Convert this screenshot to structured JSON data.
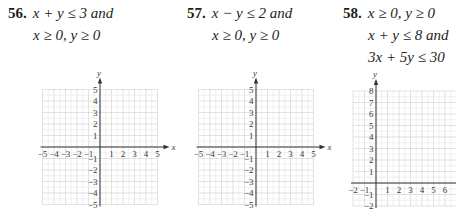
{
  "problems": [
    {
      "number": "56.",
      "lines": [
        "x + y ≤ 3 and",
        "x ≥ 0, y ≥ 0"
      ],
      "graph": {
        "xmin": -5,
        "xmax": 5,
        "ymin": -5,
        "ymax": 5,
        "x_axis_label": "x",
        "y_axis_label": "y"
      }
    },
    {
      "number": "57.",
      "lines": [
        "x − y ≤ 2 and",
        "x ≥ 0, y ≥ 0"
      ],
      "graph": {
        "xmin": -5,
        "xmax": 5,
        "ymin": -5,
        "ymax": 5,
        "x_axis_label": "x",
        "y_axis_label": "y"
      }
    },
    {
      "number": "58.",
      "lines": [
        "x ≥ 0, y ≥ 0",
        "x + y ≤ 8 and",
        "3x + 5y ≤ 30"
      ],
      "graph": {
        "xmin": -2,
        "xmax": 7,
        "ymin": -2,
        "ymax": 8,
        "x_axis_label": "x",
        "y_axis_label": "y"
      }
    }
  ],
  "chart_data": [
    {
      "type": "grid",
      "title": "56. x + y ≤ 3 and x ≥ 0, y ≥ 0",
      "xlabel": "x",
      "ylabel": "y",
      "xlim": [
        -5,
        5
      ],
      "ylim": [
        -5,
        5
      ],
      "grid": true,
      "xticks": [
        "-5",
        "-4",
        "-3",
        "-2",
        "-1",
        "1",
        "2",
        "3",
        "4",
        "5"
      ],
      "yticks": [
        "5",
        "4",
        "3",
        "2",
        "1",
        "-1",
        "-2",
        "-3",
        "-4",
        "-5"
      ]
    },
    {
      "type": "grid",
      "title": "57. x − y ≤ 2 and x ≥ 0, y ≥ 0",
      "xlabel": "x",
      "ylabel": "y",
      "xlim": [
        -5,
        5
      ],
      "ylim": [
        -5,
        5
      ],
      "grid": true,
      "xticks": [
        "-5",
        "-4",
        "-3",
        "-2",
        "-1",
        "1",
        "2",
        "3",
        "4",
        "5"
      ],
      "yticks": [
        "5",
        "4",
        "3",
        "2",
        "1",
        "-1",
        "-2",
        "-3",
        "-4",
        "-5"
      ]
    },
    {
      "type": "grid",
      "title": "58. x ≥ 0, y ≥ 0, x + y ≤ 8 and 3x + 5y ≤ 30",
      "xlabel": "x",
      "ylabel": "y",
      "xlim": [
        -2,
        7
      ],
      "ylim": [
        -2,
        8
      ],
      "grid": true,
      "xticks": [
        "-2",
        "-1",
        "1",
        "2",
        "3",
        "4",
        "5",
        "6"
      ],
      "yticks": [
        "8",
        "7",
        "6",
        "5",
        "4",
        "3",
        "2",
        "1",
        "-1",
        "-2"
      ]
    }
  ]
}
